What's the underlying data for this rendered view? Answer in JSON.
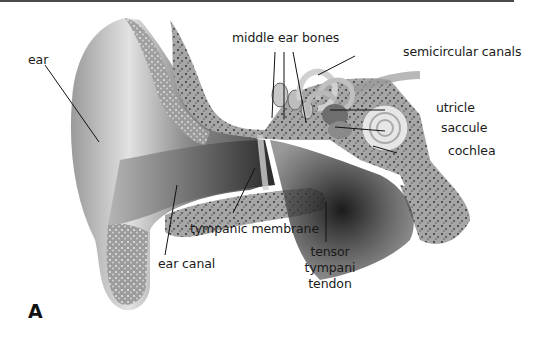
{
  "figure": {
    "panel_letter": "A",
    "colors": {
      "background": "#ffffff",
      "skin_light": "#d8d8d8",
      "skin_dark": "#6e6e6e",
      "bone": "#9a9a9a",
      "leader_line": "#111111",
      "border": "#4a4a4a"
    }
  },
  "labels": {
    "ear": "ear",
    "middle_ear_bones": "middle ear bones",
    "semicircular_canals": "semicircular canals",
    "utricle": "utricle",
    "saccule": "saccule",
    "cochlea": "cochlea",
    "tympanic_membrane": "tympanic membrane",
    "ear_canal": "ear canal",
    "tensor_tympani_tendon_1": "tensor",
    "tensor_tympani_tendon_2": "tympani",
    "tensor_tympani_tendon_3": "tendon"
  }
}
